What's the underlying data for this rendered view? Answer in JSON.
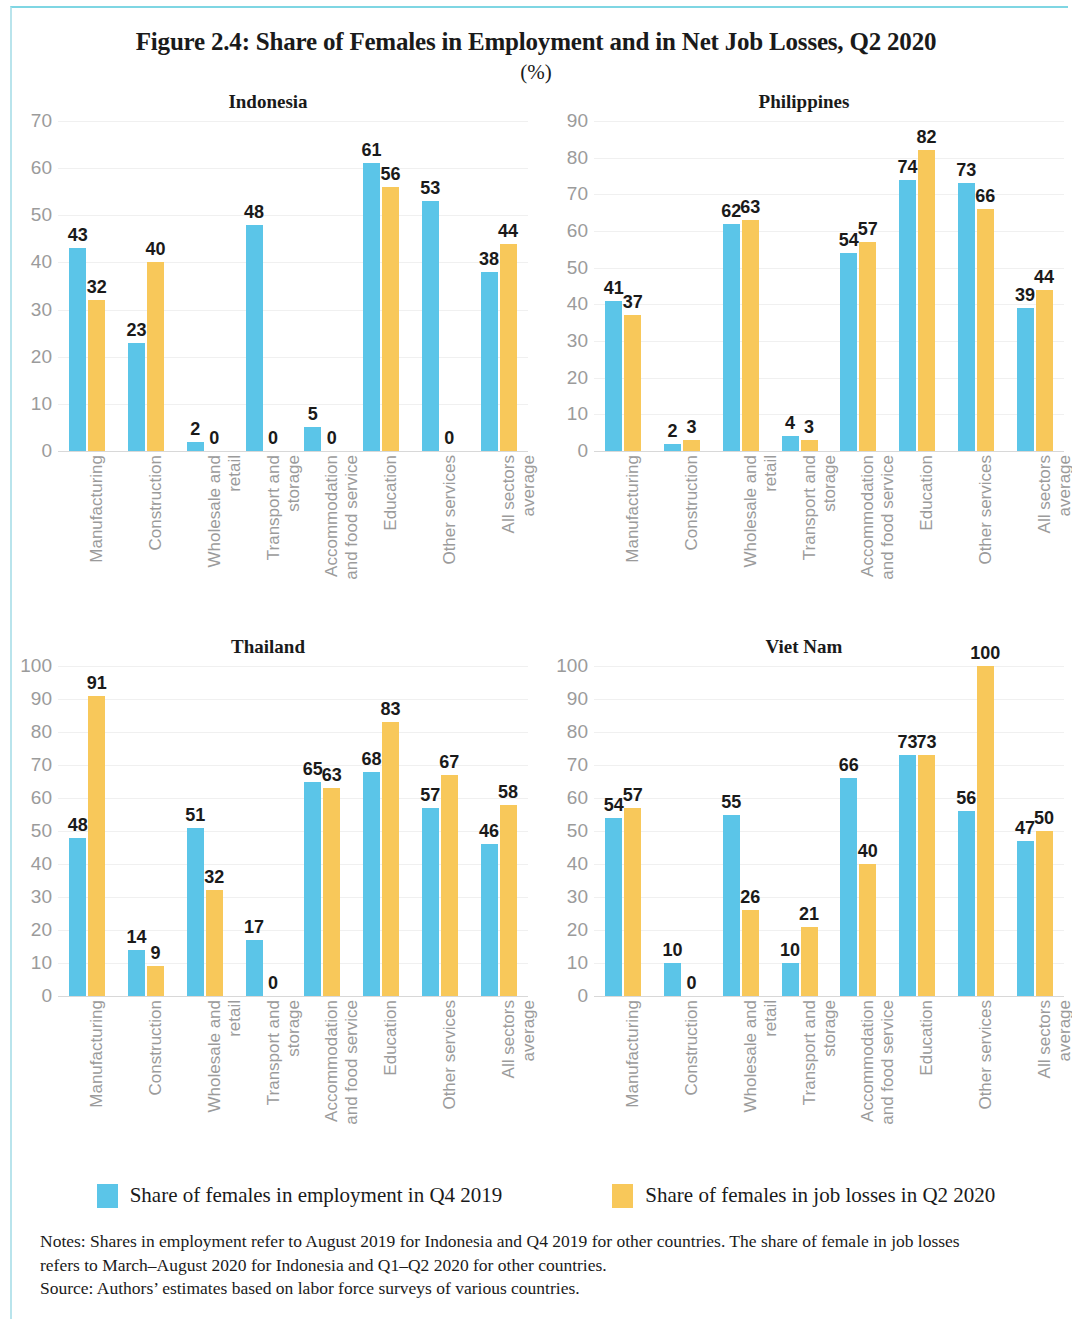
{
  "figure": {
    "title": "Figure 2.4: Share of Females in Employment and in Net Job Losses, Q2 2020",
    "subtitle": "(%)"
  },
  "legend": {
    "items": [
      {
        "label": "Share of females in employment in Q4 2019",
        "color": "#5bc5e8"
      },
      {
        "label": "Share of females in job losses in Q2 2020",
        "color": "#f8c85a"
      }
    ]
  },
  "notes": {
    "line1": "Notes: Shares in employment refer to August 2019 for Indonesia and Q4 2019 for other countries. The share of female in job losses",
    "line2": "refers to March–August 2020 for Indonesia and Q1–Q2 2020 for other countries.",
    "line3": "Source: Authors’ estimates based on labor force surveys of various countries."
  },
  "categories": [
    {
      "l1": "Manufacturing",
      "l2": ""
    },
    {
      "l1": "Construction",
      "l2": ""
    },
    {
      "l1": "Wholesale and",
      "l2": "retail"
    },
    {
      "l1": "Transport and",
      "l2": "storage"
    },
    {
      "l1": "Accommodation",
      "l2": "and food service"
    },
    {
      "l1": "Education",
      "l2": ""
    },
    {
      "l1": "Other services",
      "l2": ""
    },
    {
      "l1": "All sectors",
      "l2": "average"
    }
  ],
  "chart_data": [
    {
      "type": "bar",
      "title": "Indonesia",
      "xlabel": "",
      "ylabel": "",
      "ylim": [
        0,
        70
      ],
      "yticks": [
        0,
        10,
        20,
        30,
        40,
        50,
        60,
        70
      ],
      "grid": true,
      "legend_position": "bottom",
      "categories": [
        "Manufacturing",
        "Construction",
        "Wholesale and retail",
        "Transport and storage",
        "Accommodation and food service",
        "Education",
        "Other services",
        "All sectors average"
      ],
      "series": [
        {
          "name": "Share of females in employment in Q4 2019",
          "color": "#5bc5e8",
          "values": [
            43,
            23,
            2,
            48,
            5,
            61,
            53,
            38
          ]
        },
        {
          "name": "Share of females in job losses in Q2 2020",
          "color": "#f8c85a",
          "values": [
            32,
            40,
            0,
            0,
            0,
            56,
            0,
            44
          ]
        }
      ]
    },
    {
      "type": "bar",
      "title": "Philippines",
      "xlabel": "",
      "ylabel": "",
      "ylim": [
        0,
        90
      ],
      "yticks": [
        0,
        10,
        20,
        30,
        40,
        50,
        60,
        70,
        80,
        90
      ],
      "grid": true,
      "legend_position": "bottom",
      "categories": [
        "Manufacturing",
        "Construction",
        "Wholesale and retail",
        "Transport and storage",
        "Accommodation and food service",
        "Education",
        "Other services",
        "All sectors average"
      ],
      "series": [
        {
          "name": "Share of females in employment in Q4 2019",
          "color": "#5bc5e8",
          "values": [
            41,
            2,
            62,
            4,
            54,
            74,
            73,
            39
          ]
        },
        {
          "name": "Share of females in job losses in Q2 2020",
          "color": "#f8c85a",
          "values": [
            37,
            3,
            63,
            3,
            57,
            82,
            66,
            44
          ]
        }
      ]
    },
    {
      "type": "bar",
      "title": "Thailand",
      "xlabel": "",
      "ylabel": "",
      "ylim": [
        0,
        100
      ],
      "yticks": [
        0,
        10,
        20,
        30,
        40,
        50,
        60,
        70,
        80,
        90,
        100
      ],
      "grid": true,
      "legend_position": "bottom",
      "categories": [
        "Manufacturing",
        "Construction",
        "Wholesale and retail",
        "Transport and storage",
        "Accommodation and food service",
        "Education",
        "Other services",
        "All sectors average"
      ],
      "series": [
        {
          "name": "Share of females in employment in Q4 2019",
          "color": "#5bc5e8",
          "values": [
            48,
            14,
            51,
            17,
            65,
            68,
            57,
            46
          ]
        },
        {
          "name": "Share of females in job losses in Q2 2020",
          "color": "#f8c85a",
          "values": [
            91,
            9,
            32,
            0,
            63,
            83,
            67,
            58
          ]
        }
      ]
    },
    {
      "type": "bar",
      "title": "Viet Nam",
      "xlabel": "",
      "ylabel": "",
      "ylim": [
        0,
        100
      ],
      "yticks": [
        0,
        10,
        20,
        30,
        40,
        50,
        60,
        70,
        80,
        90,
        100
      ],
      "grid": true,
      "legend_position": "bottom",
      "categories": [
        "Manufacturing",
        "Construction",
        "Wholesale and retail",
        "Transport and storage",
        "Accommodation and food service",
        "Education",
        "Other services",
        "All sectors average"
      ],
      "series": [
        {
          "name": "Share of females in employment in Q4 2019",
          "color": "#5bc5e8",
          "values": [
            54,
            10,
            55,
            10,
            66,
            73,
            56,
            47
          ]
        },
        {
          "name": "Share of females in job losses in Q2 2020",
          "color": "#f8c85a",
          "values": [
            57,
            0,
            26,
            21,
            40,
            73,
            100,
            50
          ]
        }
      ]
    }
  ]
}
